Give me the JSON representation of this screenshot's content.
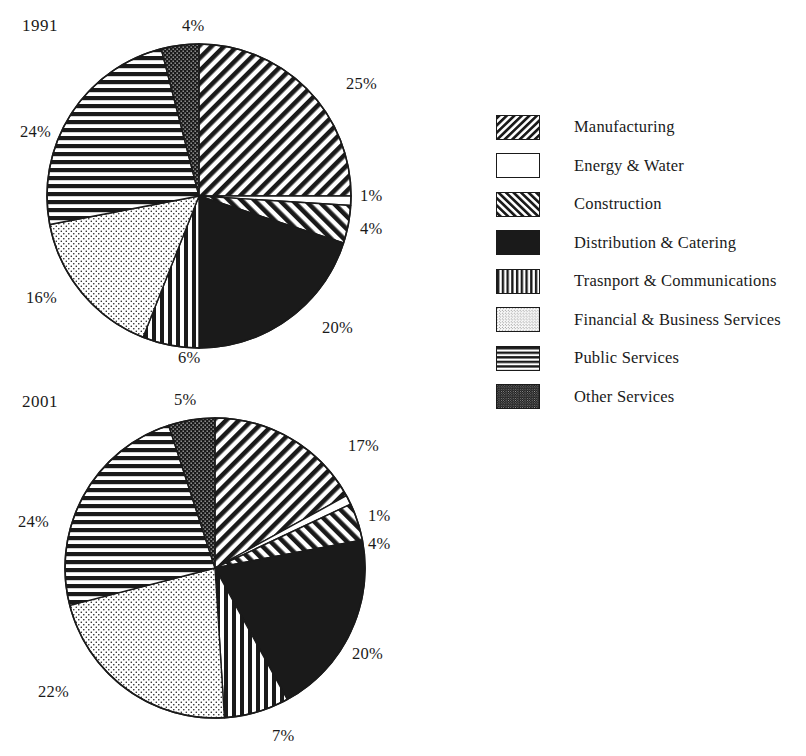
{
  "figure": {
    "title": "",
    "background_color": "#ffffff",
    "ink_color": "#1a1a1a"
  },
  "legend": {
    "position": "right",
    "items": [
      {
        "label": "Manufacturing",
        "pattern": "diagonal-backslash-hatch",
        "swatch_name": "swatch-manufacturing"
      },
      {
        "label": "Energy & Water",
        "pattern": "solid-white",
        "swatch_name": "swatch-energy-water"
      },
      {
        "label": "Construction",
        "pattern": "diagonal-forwardslash-hatch",
        "swatch_name": "swatch-construction"
      },
      {
        "label": "Distribution & Catering",
        "pattern": "solid-black",
        "swatch_name": "swatch-distribution-catering"
      },
      {
        "label": "Trasnport & Communications",
        "pattern": "vertical-stripes",
        "swatch_name": "swatch-transport-communications"
      },
      {
        "label": "Financial & Business Services",
        "pattern": "light-dots",
        "swatch_name": "swatch-financial-business-services"
      },
      {
        "label": "Public Services",
        "pattern": "horizontal-stripes",
        "swatch_name": "swatch-public-services"
      },
      {
        "label": "Other Services",
        "pattern": "dense-checkerboard",
        "swatch_name": "swatch-other-services"
      }
    ]
  },
  "chart_data": [
    {
      "type": "pie",
      "title": "1991",
      "xlabel": "",
      "ylabel": "",
      "start_angle_deg": 0,
      "direction": "clockwise",
      "geometry": {
        "cx": 199,
        "cy": 196,
        "r": 152
      },
      "categories": [
        "Manufacturing",
        "Energy & Water",
        "Construction",
        "Distribution & Catering",
        "Trasnport & Communications",
        "Financial & Business Services",
        "Public Services",
        "Other Services"
      ],
      "values": [
        25,
        1,
        4,
        20,
        6,
        16,
        24,
        4
      ],
      "value_labels": [
        "25%",
        "1%",
        "4%",
        "20%",
        "6%",
        "16%",
        "24%",
        "4%"
      ],
      "patterns": [
        "diagonal-backslash-hatch",
        "solid-white",
        "diagonal-forwardslash-hatch",
        "solid-black",
        "vertical-stripes",
        "light-dots",
        "horizontal-stripes",
        "dense-checkerboard"
      ],
      "label_positions": [
        {
          "x": 346,
          "y": 74
        },
        {
          "x": 360,
          "y": 186
        },
        {
          "x": 360,
          "y": 219
        },
        {
          "x": 322,
          "y": 318
        },
        {
          "x": 178,
          "y": 348
        },
        {
          "x": 26,
          "y": 288
        },
        {
          "x": 20,
          "y": 122
        },
        {
          "x": 182,
          "y": 16
        }
      ]
    },
    {
      "type": "pie",
      "title": "2001",
      "xlabel": "",
      "ylabel": "",
      "start_angle_deg": 0,
      "direction": "clockwise",
      "geometry": {
        "cx": 215,
        "cy": 192,
        "r": 150
      },
      "categories": [
        "Manufacturing",
        "Energy & Water",
        "Construction",
        "Distribution & Catering",
        "Trasnport & Communications",
        "Financial & Business Services",
        "Public Services",
        "Other Services"
      ],
      "values": [
        17,
        1,
        4,
        20,
        7,
        22,
        24,
        5
      ],
      "value_labels": [
        "17%",
        "1%",
        "4%",
        "20%",
        "7%",
        "22%",
        "24%",
        "5%"
      ],
      "patterns": [
        "diagonal-backslash-hatch",
        "solid-white",
        "diagonal-forwardslash-hatch",
        "solid-black",
        "vertical-stripes",
        "light-dots",
        "horizontal-stripes",
        "dense-checkerboard"
      ],
      "label_positions": [
        {
          "x": 348,
          "y": 60
        },
        {
          "x": 368,
          "y": 130
        },
        {
          "x": 368,
          "y": 158
        },
        {
          "x": 352,
          "y": 268
        },
        {
          "x": 272,
          "y": 350
        },
        {
          "x": 38,
          "y": 306
        },
        {
          "x": 18,
          "y": 136
        },
        {
          "x": 174,
          "y": 14
        }
      ]
    }
  ]
}
